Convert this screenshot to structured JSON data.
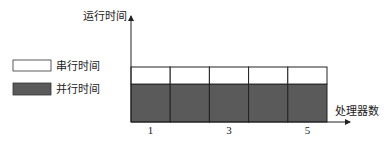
{
  "chart_data": {
    "type": "bar",
    "stacked": true,
    "title": "",
    "xlabel": "处理器数",
    "ylabel": "运行时间",
    "categories": [
      "1",
      "2",
      "3",
      "4",
      "5"
    ],
    "tick_labels": [
      "1",
      "",
      "3",
      "",
      "5"
    ],
    "series": [
      {
        "name": "并行时间",
        "color": "#5a5a5a",
        "values": [
          0.69,
          0.69,
          0.69,
          0.69,
          0.69
        ]
      },
      {
        "name": "串行时间",
        "color": "#ffffff",
        "values": [
          0.31,
          0.31,
          0.31,
          0.31,
          0.31
        ]
      }
    ],
    "ylim": [
      0,
      1.8
    ],
    "grid": false,
    "legend": {
      "placement": "left",
      "entries": [
        {
          "label": "串行时间",
          "color": "#ffffff"
        },
        {
          "label": "并行时间",
          "color": "#5a5a5a"
        }
      ]
    }
  }
}
